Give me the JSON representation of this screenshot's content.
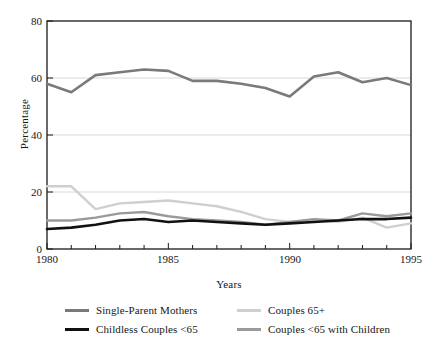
{
  "chart_data": {
    "type": "line",
    "title": "",
    "subtitle": "",
    "xlabel": "Years",
    "ylabel": "Percentage",
    "x": [
      1980,
      1981,
      1982,
      1983,
      1984,
      1985,
      1986,
      1987,
      1988,
      1989,
      1990,
      1991,
      1992,
      1993,
      1994,
      1995
    ],
    "xlim": [
      1980,
      1995
    ],
    "ylim": [
      0,
      80
    ],
    "xticks": [
      1980,
      1981,
      1982,
      1983,
      1984,
      1985,
      1986,
      1987,
      1988,
      1989,
      1990,
      1991,
      1992,
      1993,
      1994,
      1995
    ],
    "xtick_labels_shown": [
      "1980",
      "1985",
      "1990",
      "1995"
    ],
    "yticks": [
      0,
      20,
      40,
      60,
      80
    ],
    "ytick_labels": [
      "0",
      "20",
      "40",
      "60",
      "80"
    ],
    "grid": "horizontal-only",
    "gridlines_at": [
      20,
      40,
      60
    ],
    "legend_position": "below-axes",
    "legend_columns": 2,
    "series": [
      {
        "name": "Single-Parent Mothers",
        "color": "#7a7a7a",
        "width": 2.6,
        "values": [
          58,
          55,
          61,
          62,
          63,
          62.5,
          59,
          59,
          58,
          56.5,
          53.5,
          60.5,
          62,
          58.5,
          60,
          57.5
        ]
      },
      {
        "name": "Couples 65+",
        "color": "#cfcfcf",
        "width": 2.4,
        "values": [
          22,
          22,
          14,
          16,
          16.5,
          17,
          16,
          15,
          13,
          10.5,
          9.5,
          10,
          9.5,
          11,
          7.5,
          9
        ]
      },
      {
        "name": "Childless Couples <65",
        "color": "#111111",
        "width": 2.6,
        "values": [
          7,
          7.5,
          8.5,
          10,
          10.5,
          9.5,
          10,
          9.5,
          9,
          8.5,
          9,
          9.5,
          10,
          10.5,
          10.5,
          11
        ]
      },
      {
        "name": "Couples <65 with Children",
        "color": "#9a9a9a",
        "width": 2.4,
        "values": [
          10,
          10,
          11,
          12.5,
          13,
          11.5,
          10.5,
          10,
          9.5,
          8.5,
          9.5,
          10.5,
          10,
          12.5,
          11.5,
          12.5
        ]
      }
    ]
  },
  "axes": {
    "ylabel": "Percentage",
    "xlabel": "Years",
    "ytick_labels": [
      "80",
      "60",
      "40",
      "20",
      "0"
    ],
    "xtick_labels": [
      "1980",
      "1985",
      "1990",
      "1995"
    ]
  },
  "legend": {
    "items": [
      {
        "label": "Single-Parent Mothers",
        "color": "#7a7a7a",
        "thickness": "3px"
      },
      {
        "label": "Childless Couples <65",
        "color": "#111111",
        "thickness": "3px"
      },
      {
        "label": "Couples 65+",
        "color": "#cfcfcf",
        "thickness": "3px"
      },
      {
        "label": "Couples <65 with Children",
        "color": "#9a9a9a",
        "thickness": "3px"
      }
    ]
  },
  "colors": {
    "axis": "#1a1a1a",
    "grid": "#d8d8d8",
    "background": "#ffffff"
  }
}
